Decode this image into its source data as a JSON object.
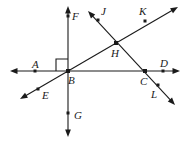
{
  "figure": {
    "kind": "geometry-line-diagram",
    "width": 189,
    "height": 143,
    "background_color": "#ffffff",
    "stroke_color": "#1a1a1a",
    "point_marker_color": "#1a1a1a",
    "right_angle_marker": {
      "vertex": "B",
      "between_rays": [
        "BA",
        "BF"
      ],
      "quadrant": "upper-left",
      "size_px": 12
    },
    "labels": [
      {
        "name": "label-A",
        "text": "A",
        "x": 32,
        "y": 59
      },
      {
        "name": "label-B",
        "text": "B",
        "x": 68,
        "y": 75
      },
      {
        "name": "label-C",
        "text": "C",
        "x": 140,
        "y": 76
      },
      {
        "name": "label-D",
        "text": "D",
        "x": 160,
        "y": 58
      },
      {
        "name": "label-E",
        "text": "E",
        "x": 42,
        "y": 90
      },
      {
        "name": "label-F",
        "text": "F",
        "x": 72,
        "y": 11
      },
      {
        "name": "label-G",
        "text": "G",
        "x": 74,
        "y": 110
      },
      {
        "name": "label-H",
        "text": "H",
        "x": 111,
        "y": 48
      },
      {
        "name": "label-J",
        "text": "J",
        "x": 101,
        "y": 6
      },
      {
        "name": "label-K",
        "text": "K",
        "x": 139,
        "y": 6
      },
      {
        "name": "label-L",
        "text": "L",
        "x": 151,
        "y": 89
      }
    ],
    "points": [
      {
        "name": "point-A",
        "label": "A",
        "x": 35,
        "y": 71
      },
      {
        "name": "point-B",
        "label": "B",
        "x": 68,
        "y": 71
      },
      {
        "name": "point-C",
        "label": "C",
        "x": 145,
        "y": 71
      },
      {
        "name": "point-D",
        "label": "D",
        "x": 163,
        "y": 71
      },
      {
        "name": "point-E",
        "label": "E",
        "x": 38,
        "y": 89
      },
      {
        "name": "point-F",
        "label": "F",
        "x": 68,
        "y": 16
      },
      {
        "name": "point-G",
        "label": "G",
        "x": 68,
        "y": 113
      },
      {
        "name": "point-H",
        "label": "H",
        "x": 116,
        "y": 43
      },
      {
        "name": "point-J",
        "label": "J",
        "x": 98,
        "y": 20
      },
      {
        "name": "point-K",
        "label": "K",
        "x": 145,
        "y": 21
      },
      {
        "name": "point-L",
        "label": "L",
        "x": 158,
        "y": 85
      }
    ],
    "lines": [
      {
        "name": "line-horizontal-ABCD",
        "through_points": [
          "A",
          "B",
          "C",
          "D"
        ],
        "x1": 10,
        "y1": 71,
        "x2": 180,
        "y2": 71,
        "arrow_start": true,
        "arrow_end": true
      },
      {
        "name": "line-vertical-FBG",
        "through_points": [
          "F",
          "B",
          "G"
        ],
        "x1": 68,
        "y1": 6,
        "x2": 68,
        "y2": 137,
        "arrow_start": true,
        "arrow_end": true
      },
      {
        "name": "line-diagonal-EBHK",
        "through_points": [
          "E",
          "B",
          "H",
          "K"
        ],
        "x1": 20,
        "y1": 99,
        "x2": 178,
        "y2": 7,
        "arrow_start": true,
        "arrow_end": true
      },
      {
        "name": "line-diagonal-JHCL",
        "through_points": [
          "J",
          "H",
          "C",
          "L"
        ],
        "x1": 88,
        "y1": 11,
        "x2": 175,
        "y2": 105,
        "arrow_start": true,
        "arrow_end": true
      }
    ],
    "intersections": [
      {
        "name": "intersection-B",
        "label": "B",
        "lines": [
          "line-horizontal-ABCD",
          "line-vertical-FBG",
          "line-diagonal-EBHK"
        ]
      },
      {
        "name": "intersection-H",
        "label": "H",
        "lines": [
          "line-diagonal-EBHK",
          "line-diagonal-JHCL"
        ]
      },
      {
        "name": "intersection-C",
        "label": "C",
        "lines": [
          "line-horizontal-ABCD",
          "line-diagonal-JHCL"
        ]
      }
    ]
  }
}
